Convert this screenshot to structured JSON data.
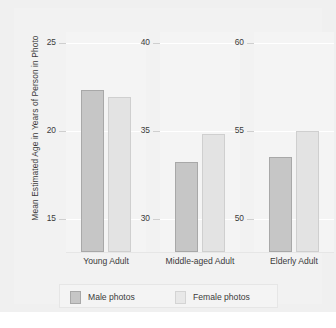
{
  "chart_data": {
    "type": "bar",
    "title": "",
    "subtitle": "",
    "xlabel": "",
    "ylabel": "Mean Estimated Age in Years of Person in Photo",
    "grid": true,
    "legend_position": "bottom",
    "categories": [
      "Young Adult",
      "Middle-aged Adult",
      "Elderly Adult"
    ],
    "series": [
      {
        "name": "Male photos",
        "color": "#c6c6c6",
        "values": [
          22.3,
          33.2,
          53.5
        ]
      },
      {
        "name": "Female photos",
        "color": "#e3e3e3",
        "values": [
          21.9,
          34.8,
          55.0
        ]
      }
    ],
    "panels": [
      {
        "category": "Young Adult",
        "ylim": [
          13.1,
          25.6
        ],
        "ticks": [
          25,
          20,
          15
        ],
        "tick_labels": [
          "25",
          "20",
          "15"
        ]
      },
      {
        "category": "Middle-aged Adult",
        "ylim": [
          28.1,
          40.6
        ],
        "ticks": [
          40,
          35,
          30
        ],
        "tick_labels": [
          "40",
          "35",
          "30"
        ]
      },
      {
        "category": "Elderly Adult",
        "ylim": [
          48.1,
          60.6
        ],
        "ticks": [
          60,
          55,
          50
        ],
        "tick_labels": [
          "60",
          "55",
          "50"
        ]
      }
    ]
  },
  "legend": {
    "entries": [
      {
        "label": "Male photos",
        "swatch": "male"
      },
      {
        "label": "Female photos",
        "swatch": "female"
      }
    ]
  },
  "colors": {
    "figure_background": "#f0f0f0",
    "panel_background": "#f4f4f4",
    "gridline": "#ffffff",
    "male_bar": "#c6c6c6",
    "female_bar": "#e3e3e3",
    "text": "#3b3b3b"
  }
}
